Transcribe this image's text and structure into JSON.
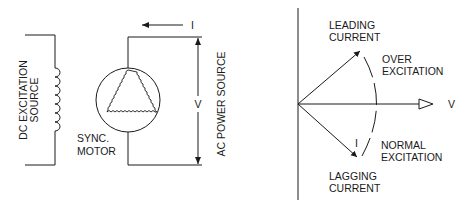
{
  "left_diagram": {
    "dc_source_label": [
      "DC EXCITATION",
      "SOURCE"
    ],
    "motor_label": [
      "SYNC.",
      "MOTOR"
    ],
    "ac_source_label": "AC POWER SOURCE",
    "voltage_label": "V",
    "current_label": "I"
  },
  "right_diagram": {
    "leading_label": [
      "LEADING",
      "CURRENT"
    ],
    "over_label": [
      "OVER",
      "EXCITATION"
    ],
    "normal_label": [
      "NORMAL",
      "EXCITATION"
    ],
    "lagging_label": [
      "LAGGING",
      "CURRENT"
    ],
    "voltage_label": "V",
    "current_label": "I"
  },
  "colors": {
    "ink": "#1a1a1a",
    "background": "#ffffff"
  }
}
